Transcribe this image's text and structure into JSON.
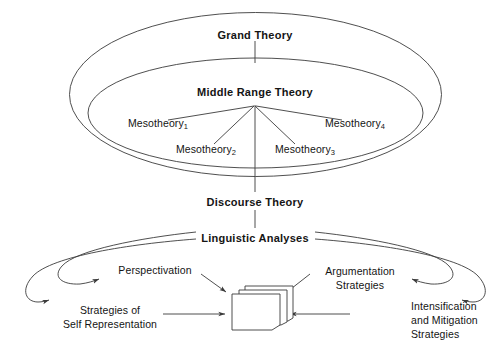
{
  "diagram": {
    "type": "nested-ellipse-hierarchy",
    "colors": {
      "stroke": "#3b3b3b",
      "text": "#141414",
      "background": "#ffffff",
      "document": "#ffffff"
    },
    "levels": {
      "grand_theory": "Grand Theory",
      "middle_range_theory": "Middle Range Theory",
      "discourse_theory": "Discourse Theory",
      "linguistic_analyses": "Linguistic Analyses"
    },
    "mesotheories": [
      {
        "base": "Mesotheory",
        "sub": "1"
      },
      {
        "base": "Mesotheory",
        "sub": "2"
      },
      {
        "base": "Mesotheory",
        "sub": "3"
      },
      {
        "base": "Mesotheory",
        "sub": "4"
      }
    ],
    "strategies": {
      "perspectivation": "Perspectivation",
      "self_representation_line1": "Strategies of",
      "self_representation_line2": "Self Representation",
      "argumentation_line1": "Argumentation",
      "argumentation_line2": "Strategies",
      "intensification_line1": "Intensification",
      "intensification_line2": "and Mitigation",
      "intensification_line3": "Strategies"
    },
    "document_stack": {
      "name": "text-corpus",
      "pages": 3
    }
  }
}
